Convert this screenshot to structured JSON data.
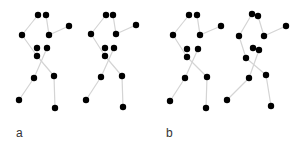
{
  "panels": [
    {
      "label": "a",
      "label_pos": [
        16,
        127
      ],
      "figures": [
        {
          "joints": {
            "head_l": [
              38,
              15
            ],
            "head_r": [
              46,
              15
            ],
            "elbow_l": [
              22,
              35
            ],
            "elbow_r": [
              49,
              35
            ],
            "hand_r": [
              69,
              26
            ],
            "hip_l": [
              37,
              48
            ],
            "hip_r": [
              47,
              48
            ],
            "hip_c": [
              37,
              56
            ],
            "knee_l": [
              34,
              78
            ],
            "knee_r": [
              54,
              76
            ],
            "foot_l": [
              19,
              100
            ],
            "foot_r": [
              55,
              108
            ]
          }
        },
        {
          "joints": {
            "head_l": [
              106,
              15
            ],
            "head_r": [
              113,
              15
            ],
            "elbow_l": [
              91,
              34
            ],
            "elbow_r": [
              116,
              34
            ],
            "hand_r": [
              136,
              25
            ],
            "hip_l": [
              105,
              48
            ],
            "hip_r": [
              114,
              48
            ],
            "hip_c": [
              105,
              56
            ],
            "knee_l": [
              101,
              77
            ],
            "knee_r": [
              122,
              76
            ],
            "foot_l": [
              86,
              100
            ],
            "foot_r": [
              123,
              107
            ]
          }
        }
      ]
    },
    {
      "label": "b",
      "label_pos": [
        166,
        127
      ],
      "figures": [
        {
          "joints": {
            "head_l": [
              189,
              15
            ],
            "head_r": [
              197,
              15
            ],
            "elbow_l": [
              173,
              35
            ],
            "elbow_r": [
              200,
              35
            ],
            "hand_r": [
              221,
              26
            ],
            "hip_l": [
              187,
              49
            ],
            "hip_r": [
              198,
              49
            ],
            "hip_c": [
              187,
              57
            ],
            "knee_l": [
              185,
              78
            ],
            "knee_r": [
              207,
              77
            ],
            "foot_l": [
              170,
              101
            ],
            "foot_r": [
              206,
              108
            ]
          }
        },
        {
          "joints": {
            "head_l": [
              252,
              14
            ],
            "head_r": [
              258,
              16
            ],
            "elbow_l": [
              239,
              36
            ],
            "elbow_r": [
              264,
              36
            ],
            "hand_r": [
              286,
              26
            ],
            "hip_l": [
              253,
              48
            ],
            "hip_r": [
              259,
              50
            ],
            "hip_c": [
              246,
              58
            ],
            "knee_l": [
              249,
              78
            ],
            "knee_r": [
              266,
              75
            ],
            "foot_l": [
              227,
              100
            ],
            "foot_r": [
              271,
              106
            ]
          }
        }
      ]
    }
  ],
  "bones": [
    [
      "head_l",
      "elbow_l"
    ],
    [
      "head_r",
      "elbow_r"
    ],
    [
      "elbow_r",
      "hand_r"
    ],
    [
      "elbow_l",
      "hip_c"
    ],
    [
      "hip_r",
      "knee_l"
    ],
    [
      "knee_l",
      "foot_l"
    ],
    [
      "hip_c",
      "knee_r"
    ],
    [
      "knee_r",
      "foot_r"
    ]
  ],
  "colors": {
    "joint": "#000000",
    "bone": "#d4d4d4",
    "label": "#333333"
  },
  "joint_radius": 3.2
}
